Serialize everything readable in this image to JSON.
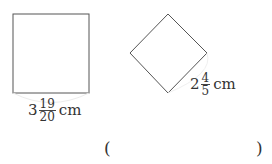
{
  "figures": {
    "square": {
      "side_label": {
        "whole": "3",
        "numerator": "19",
        "denominator": "20",
        "unit": "cm"
      }
    },
    "rhombus": {
      "side_label": {
        "whole": "2",
        "numerator": "4",
        "denominator": "5",
        "unit": "cm"
      }
    }
  },
  "answer": {
    "open_paren": "(",
    "close_paren": ")",
    "value": ""
  },
  "colors": {
    "stroke": "#555555",
    "text": "#333333",
    "arc": "#e6e6e6"
  }
}
